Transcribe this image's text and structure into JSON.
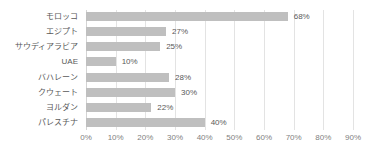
{
  "chart_data": {
    "type": "bar",
    "orientation": "horizontal",
    "title": "",
    "subtitle": "",
    "xlabel": "",
    "ylabel": "",
    "categories": [
      "モロッコ",
      "エジプト",
      "サウディアラビア",
      "UAE",
      "バハレーン",
      "クウェート",
      "ヨルダン",
      "パレスチナ"
    ],
    "values": [
      68,
      27,
      25,
      10,
      28,
      30,
      22,
      40
    ],
    "data_labels": [
      "68%",
      "27%",
      "25%",
      "10%",
      "28%",
      "30%",
      "22%",
      "40%"
    ],
    "xlim": [
      0,
      90
    ],
    "x_tick_values": [
      0,
      10,
      20,
      30,
      40,
      50,
      60,
      70,
      80,
      90
    ],
    "x_tick_labels": [
      "0%",
      "10%",
      "20%",
      "30%",
      "40%",
      "50%",
      "60%",
      "70%",
      "80%",
      "90%"
    ],
    "grid": true,
    "grid_axis": "x",
    "legend": false,
    "legend_position": "none",
    "bar_color": "#bfbfbf",
    "gridline_color": "#e3e3e3",
    "label_color": "#595959",
    "tick_color": "#7f7f7f",
    "background_color": "#ffffff"
  }
}
